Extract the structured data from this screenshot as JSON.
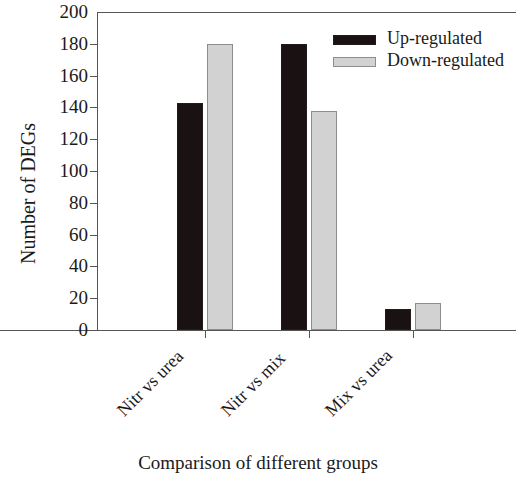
{
  "chart_data": {
    "type": "bar",
    "title": "",
    "xlabel": "Comparison of different groups",
    "ylabel": "Number of DEGs",
    "categories": [
      "Nitr vs urea",
      "Nitr vs mix",
      "Mix vs urea"
    ],
    "series": [
      {
        "name": "Up-regulated",
        "color": "#1a1212",
        "values": [
          143,
          180,
          13
        ]
      },
      {
        "name": "Down-regulated",
        "color": "#d2d2d2",
        "values": [
          180,
          138,
          17
        ]
      }
    ],
    "ylim": [
      0,
      200
    ],
    "yticks": [
      0,
      20,
      40,
      60,
      80,
      100,
      120,
      140,
      160,
      180,
      200
    ],
    "ytick_labels": [
      "0",
      "20",
      "40",
      "60",
      "80",
      "100",
      "120",
      "140",
      "160",
      "180",
      "200"
    ],
    "grid": false,
    "legend_position": "top-right",
    "xtick_label_rotation": -45
  },
  "legend": {
    "entries": [
      {
        "label": "Up-regulated"
      },
      {
        "label": "Down-regulated"
      }
    ]
  },
  "axes": {
    "y_title": "Number of DEGs",
    "x_title": "Comparison of different groups"
  },
  "bar_values": {
    "nitr_vs_urea": {
      "up": 143,
      "down": 180
    },
    "nitr_vs_mix": {
      "up": 99,
      "down": 138
    },
    "mix_vs_urea": {
      "up": 13,
      "down": 17
    }
  }
}
